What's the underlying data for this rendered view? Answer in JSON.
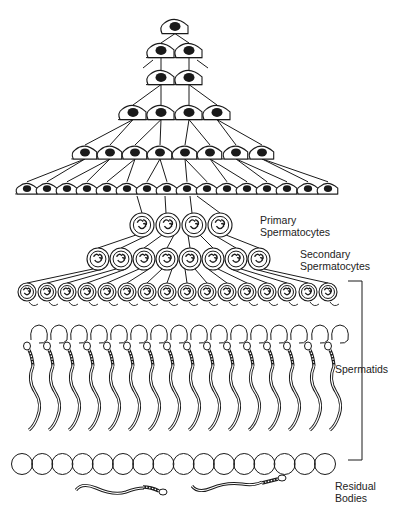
{
  "diagram": {
    "colors": {
      "ink": "#1a1a1a",
      "background": "#ffffff"
    },
    "labels": {
      "primary": [
        "Primary",
        "Spermatocytes"
      ],
      "secondary": [
        "Secondary",
        "Spermatocytes"
      ],
      "spermatids": "Spermatids",
      "residual": [
        "Residual",
        "Bodies"
      ]
    },
    "spermatogonia_rows": [
      {
        "count": 1,
        "y": 27,
        "xs": [
          175
        ]
      },
      {
        "count": 2,
        "y": 51,
        "xs": [
          161,
          189
        ]
      },
      {
        "count": 2,
        "y": 78,
        "xs": [
          161,
          189
        ]
      },
      {
        "count": 4,
        "y": 113,
        "xs": [
          133,
          161,
          189,
          217
        ]
      },
      {
        "count": 8,
        "y": 153,
        "xs": [
          85,
          110,
          135,
          160,
          185,
          210,
          236,
          262
        ]
      },
      {
        "count": 16,
        "y": 189,
        "xs": [
          27,
          47,
          67,
          87,
          107,
          127,
          147,
          167,
          187,
          207,
          227,
          247,
          267,
          287,
          308,
          328
        ]
      }
    ],
    "primary_spermatocytes": {
      "count": 4,
      "y": 225,
      "xs": [
        142,
        168,
        194,
        220
      ]
    },
    "secondary_spermatocytes": {
      "count": 8,
      "y": 259,
      "xs": [
        98,
        121,
        144,
        167,
        190,
        213,
        236,
        259
      ]
    },
    "spermatids": {
      "count": 16,
      "y": 292,
      "xs": [
        27,
        47,
        67,
        87,
        107,
        127,
        147,
        167,
        187,
        207,
        227,
        247,
        267,
        287,
        308,
        328
      ]
    },
    "residual_bodies": {
      "count": 16,
      "y": 464
    }
  }
}
